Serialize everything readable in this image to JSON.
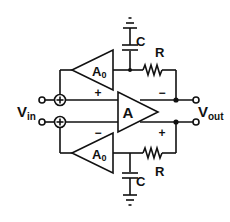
{
  "diagram": {
    "type": "circuit-schematic",
    "colors": {
      "stroke": "#111111",
      "background": "#ffffff"
    },
    "input": {
      "label_main": "V",
      "label_sub": "in"
    },
    "output": {
      "label_main": "V",
      "label_sub": "out"
    },
    "main_amplifier": {
      "label": "A",
      "top_input_sign": "+",
      "bottom_input_sign": "−",
      "top_output_sign": "−",
      "bottom_output_sign": "+"
    },
    "top_feedback": {
      "amplifier": {
        "label_main": "A",
        "label_sub": "0"
      },
      "capacitor": {
        "label": "C"
      },
      "resistor": {
        "label": "R"
      },
      "summer_symbol": "+"
    },
    "bottom_feedback": {
      "amplifier": {
        "label_main": "A",
        "label_sub": "0"
      },
      "capacitor": {
        "label": "C"
      },
      "resistor": {
        "label": "R"
      },
      "summer_symbol": "+"
    }
  }
}
